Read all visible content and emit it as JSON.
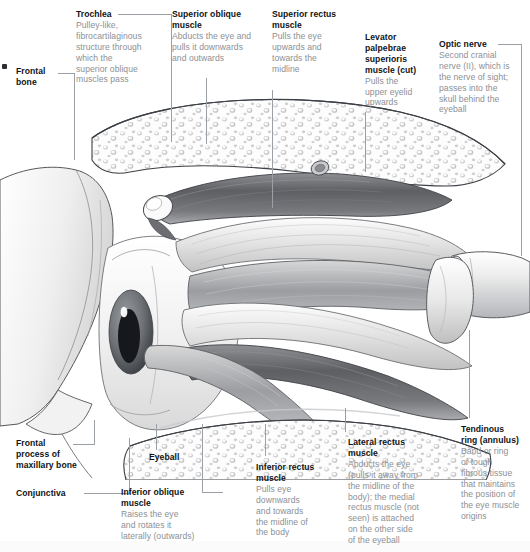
{
  "diagram": {
    "type": "anatomical-illustration",
    "style": "grayscale pencil rendering",
    "colors": {
      "background": "#ffffff",
      "heading_text": "#111316",
      "body_text": "#8c9095",
      "leader_line": "#9aa0a6",
      "bone_fill": "#f3f3f3",
      "bone_outline": "#3c4045",
      "muscle_light": "#e3e3e3",
      "muscle_mid": "#a8a8a8",
      "muscle_dark": "#5f6165",
      "iris": "#6a6d72",
      "pupil": "#16181b"
    }
  },
  "labels": {
    "frontal_bone": {
      "title": "Frontal\nbone",
      "title_lines": [
        "Frontal",
        "bone"
      ],
      "description": ""
    },
    "trochlea": {
      "title": "Trochlea",
      "description": "Pulley-like, fibrocartilaginous structure through which the superior oblique muscles pass",
      "description_lines": [
        "Pulley-like,",
        "fibrocartilaginous",
        "structure through",
        "which the",
        "superior oblique",
        "muscles pass"
      ]
    },
    "superior_oblique_muscle": {
      "title": "Superior oblique muscle",
      "title_lines": [
        "Superior oblique",
        "muscle"
      ],
      "description": "Abducts the eye and pulls it downwards and outwards",
      "description_lines": [
        "Abducts the eye and",
        "pulls it downwards",
        "and outwards"
      ]
    },
    "superior_rectus_muscle": {
      "title": "Superior rectus muscle",
      "title_lines": [
        "Superior rectus",
        "muscle"
      ],
      "description": "Pulls the eye upwards and towards the midline",
      "description_lines": [
        "Pulls the eye",
        "upwards and",
        "towards the",
        "midline"
      ]
    },
    "levator_palpebrae": {
      "title": "Levator palpebrae superioris muscle (cut)",
      "title_lines": [
        "Levator",
        "palpebrae",
        "superioris",
        "muscle (cut)"
      ],
      "description": "Pulls the upper eyelid upwards",
      "description_lines": [
        "Pulls the",
        "upper eyelid",
        "upwards"
      ]
    },
    "optic_nerve": {
      "title": "Optic nerve",
      "description": "Second cranial nerve (II), which is the nerve of sight; passes into the skull behind the eyeball",
      "description_lines": [
        "Second cranial",
        "nerve (II), which is",
        "the nerve of sight;",
        "passes into the",
        "skull behind the",
        "eyeball"
      ]
    },
    "frontal_process": {
      "title": "Frontal process of maxillary bone",
      "title_lines": [
        "Frontal",
        "process of",
        "maxillary bone"
      ],
      "description": ""
    },
    "conjunctiva": {
      "title": "Conjunctiva",
      "description": ""
    },
    "eyeball": {
      "title": "Eyeball",
      "description": ""
    },
    "inferior_oblique_muscle": {
      "title": "Inferior oblique muscle",
      "title_lines": [
        "Inferior oblique",
        "muscle"
      ],
      "description": "Raises the eye and rotates it laterally (outwards)",
      "description_lines": [
        "Raises the eye",
        "and rotates it",
        "laterally (outwards)"
      ]
    },
    "inferior_rectus_muscle": {
      "title": "Inferior rectus muscle",
      "title_lines": [
        "Inferior rectus",
        "muscle"
      ],
      "description": "Pulls eye downwards and towards the midline of the body",
      "description_lines": [
        "Pulls eye",
        "downwards",
        "and towards",
        "the midline of",
        "the body"
      ]
    },
    "lateral_rectus_muscle": {
      "title": "Lateral rectus muscle",
      "title_lines": [
        "Lateral rectus",
        "muscle"
      ],
      "description": "Abducts the eye (pulls it away from the midline of the body); the medial rectus muscle (not seen) is attached on the other side of the eyeball",
      "description_lines": [
        "Abducts the eye",
        "(pulls it away from",
        "the midline of the",
        "body); the medial",
        "rectus muscle (not",
        "seen) is attached",
        "on the other side",
        "of the eyeball"
      ]
    },
    "tendinous_ring": {
      "title": "Tendinous ring (annulus)",
      "title_lines": [
        "Tendinous",
        "ring (annulus)"
      ],
      "description": "Band or ring of tough fibrous tissue that maintains the position of the eye muscle origins",
      "description_lines": [
        "Band or ring",
        "of tough",
        "fibrous tissue",
        "that maintains",
        "the position of",
        "the eye muscle",
        "origins"
      ]
    }
  }
}
